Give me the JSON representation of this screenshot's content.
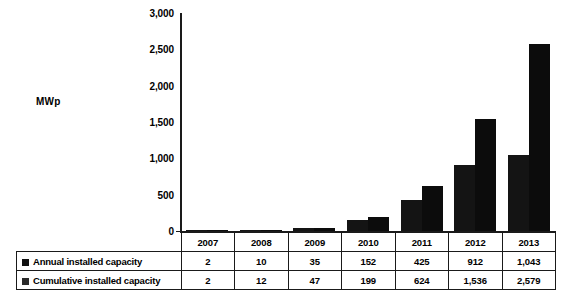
{
  "chart_data": {
    "type": "bar",
    "title": "",
    "xlabel": "",
    "ylabel": "MWp",
    "ylim": [
      0,
      3000
    ],
    "ytick_values": [
      3000,
      2500,
      2000,
      1500,
      1000,
      500,
      0
    ],
    "ytick_labels": [
      "3,000",
      "2,500",
      "2,000",
      "1,500",
      "1,000",
      "500",
      "0"
    ],
    "grid": false,
    "legend_position": "bottom-table",
    "categories": [
      "2007",
      "2008",
      "2009",
      "2010",
      "2011",
      "2012",
      "2013"
    ],
    "series": [
      {
        "name": "Annual installed capacity",
        "color": "#141414",
        "values": [
          2,
          10,
          35,
          152,
          425,
          912,
          1043
        ],
        "value_labels": [
          "2",
          "10",
          "35",
          "152",
          "425",
          "912",
          "1,043"
        ]
      },
      {
        "name": "Cumulative installed capacity",
        "color": "#0c0c0c",
        "values": [
          2,
          12,
          47,
          199,
          624,
          1536,
          2579
        ],
        "value_labels": [
          "2",
          "12",
          "47",
          "199",
          "624",
          "1,536",
          "2,579"
        ]
      }
    ]
  },
  "axis": {
    "y_title": "MWp"
  },
  "table": {
    "header_label": "",
    "columns": [
      "2007",
      "2008",
      "2009",
      "2010",
      "2011",
      "2012",
      "2013"
    ],
    "rows": [
      {
        "label": "Annual installed capacity",
        "swatch": "annual-series-swatch",
        "cells": [
          "2",
          "10",
          "35",
          "152",
          "425",
          "912",
          "1,043"
        ]
      },
      {
        "label": "Cumulative installed capacity",
        "swatch": "cumulative-series-swatch",
        "cells": [
          "2",
          "12",
          "47",
          "199",
          "624",
          "1,536",
          "2,579"
        ]
      }
    ]
  },
  "colors": {
    "annual": "#141414",
    "cumulative": "#0c0c0c",
    "axis": "#1a1a1a",
    "background": "#ffffff"
  }
}
